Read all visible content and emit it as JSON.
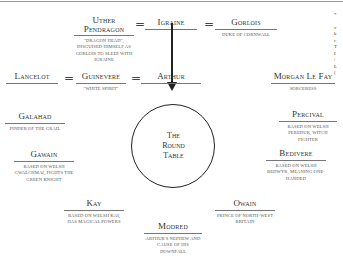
{
  "diagram": {
    "title_circle": {
      "line1": "The",
      "line2": "Round",
      "line3": "Table"
    },
    "equals_sign": "=",
    "nodes": {
      "uther": {
        "name_line1": "Uther",
        "name_line2": "Pendragon",
        "desc": "\"Dragon head\", disguised himself as Gorlois to sleep with Igraine"
      },
      "igraine": {
        "name": "Igraine",
        "desc": ""
      },
      "gorlois": {
        "name": "Gorlois",
        "desc": "Duke of Cornwall"
      },
      "lancelot": {
        "name": "Lancelot",
        "desc": ""
      },
      "guinevere": {
        "name": "Guinevere",
        "desc": "\"White spirit\""
      },
      "arthur": {
        "name": "Arthur",
        "desc": ""
      },
      "morgan": {
        "name": "Morgan Le Fay",
        "desc": "Sorceress"
      },
      "galahad": {
        "name": "Galahad",
        "desc": "Finder of the Grail"
      },
      "gawain": {
        "name": "Gawain",
        "desc": "Based on Welsh Gwalchmai, fights the Green Knight"
      },
      "percival": {
        "name": "Percival",
        "desc": "Based on Welsh Peredur, witch fighter"
      },
      "bedivere": {
        "name": "Bedivere",
        "desc": "Based on Welsh Bedwyr, meaning one-handed"
      },
      "kay": {
        "name": "Kay",
        "desc": "Based on Welsh Kai, has magical powers"
      },
      "owain": {
        "name": "Owain",
        "desc": "Prince of North-West Britain"
      },
      "modred": {
        "name": "Modred",
        "desc": "Arthur's nephew and cause of his downfall"
      }
    },
    "relations": [
      {
        "from": "Uther Pendragon",
        "to": "Igraine",
        "type": "married"
      },
      {
        "from": "Igraine",
        "to": "Gorlois",
        "type": "married"
      },
      {
        "from": "Lancelot",
        "to": "Guinevere",
        "type": "lovers"
      },
      {
        "from": "Guinevere",
        "to": "Arthur",
        "type": "married"
      },
      {
        "from": "Igraine",
        "to": "Arthur",
        "type": "parent"
      }
    ],
    "edge_fragment": {
      "lines": [
        "*",
        "",
        "v",
        "k",
        "r",
        "T",
        "I",
        "/",
        "L",
        "("
      ]
    }
  }
}
